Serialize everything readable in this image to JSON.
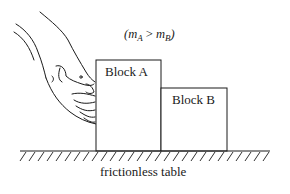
{
  "diagram": {
    "mass_relation": {
      "m1": "m",
      "m1_sub": "A",
      "op": " > ",
      "m2": "m",
      "m2_sub": "B",
      "open": "(",
      "close": ")"
    },
    "block_a": {
      "label": "Block A"
    },
    "block_b": {
      "label": "Block B"
    },
    "table": {
      "label": "frictionless table"
    },
    "colors": {
      "stroke": "#1a1a1a",
      "background": "#ffffff"
    }
  }
}
